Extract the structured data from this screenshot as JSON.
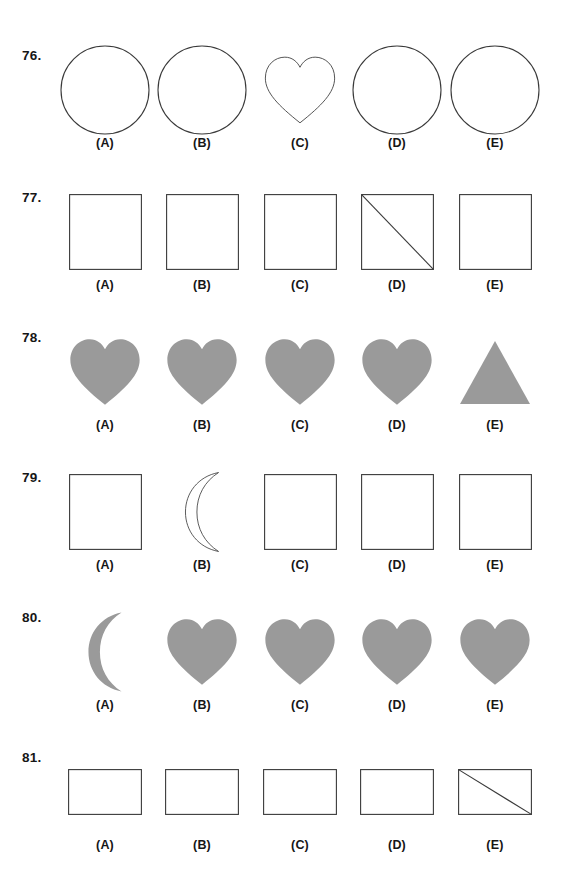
{
  "page": {
    "background_color": "#ffffff",
    "outline_color": "#3a3a3a",
    "fill_color": "#9a9a9a",
    "text_color": "#161616"
  },
  "option_labels": [
    "(A)",
    "(B)",
    "(C)",
    "(D)",
    "(E)"
  ],
  "rows": [
    {
      "number": "76.",
      "shapes": [
        {
          "name": "circle-outline",
          "type": "circle",
          "style": "outline"
        },
        {
          "name": "circle-outline",
          "type": "circle",
          "style": "outline"
        },
        {
          "name": "heart-outline",
          "type": "heart",
          "style": "outline"
        },
        {
          "name": "circle-outline",
          "type": "circle",
          "style": "outline"
        },
        {
          "name": "circle-outline",
          "type": "circle",
          "style": "outline"
        }
      ],
      "labels": [
        "(A)",
        "(B)",
        "(C)",
        "(D)",
        "(E)"
      ]
    },
    {
      "number": "77.",
      "shapes": [
        {
          "name": "square-outline",
          "type": "square",
          "style": "outline"
        },
        {
          "name": "square-outline",
          "type": "square",
          "style": "outline"
        },
        {
          "name": "square-outline",
          "type": "square",
          "style": "outline"
        },
        {
          "name": "square-with-diagonal",
          "type": "square-diagonal",
          "style": "outline"
        },
        {
          "name": "square-outline",
          "type": "square",
          "style": "outline"
        }
      ],
      "labels": [
        "(A)",
        "(B)",
        "(C)",
        "(D)",
        "(E)"
      ]
    },
    {
      "number": "78.",
      "shapes": [
        {
          "name": "heart-filled",
          "type": "heart",
          "style": "filled"
        },
        {
          "name": "heart-filled",
          "type": "heart",
          "style": "filled"
        },
        {
          "name": "heart-filled",
          "type": "heart",
          "style": "filled"
        },
        {
          "name": "heart-filled",
          "type": "heart",
          "style": "filled"
        },
        {
          "name": "triangle-filled",
          "type": "triangle",
          "style": "filled"
        }
      ],
      "labels": [
        "(A)",
        "(B)",
        "(C)",
        "(D)",
        "(E)"
      ]
    },
    {
      "number": "79.",
      "shapes": [
        {
          "name": "square-outline",
          "type": "square",
          "style": "outline"
        },
        {
          "name": "crescent-outline",
          "type": "crescent",
          "style": "outline"
        },
        {
          "name": "square-outline",
          "type": "square",
          "style": "outline"
        },
        {
          "name": "square-outline",
          "type": "square",
          "style": "outline"
        },
        {
          "name": "square-outline",
          "type": "square",
          "style": "outline"
        }
      ],
      "labels": [
        "(A)",
        "(B)",
        "(C)",
        "(D)",
        "(E)"
      ]
    },
    {
      "number": "80.",
      "shapes": [
        {
          "name": "crescent-filled",
          "type": "crescent",
          "style": "filled"
        },
        {
          "name": "heart-filled",
          "type": "heart",
          "style": "filled"
        },
        {
          "name": "heart-filled",
          "type": "heart",
          "style": "filled"
        },
        {
          "name": "heart-filled",
          "type": "heart",
          "style": "filled"
        },
        {
          "name": "heart-filled",
          "type": "heart",
          "style": "filled"
        }
      ],
      "labels": [
        "(A)",
        "(B)",
        "(C)",
        "(D)",
        "(E)"
      ]
    },
    {
      "number": "81.",
      "shapes": [
        {
          "name": "rectangle-outline",
          "type": "rectangle",
          "style": "outline"
        },
        {
          "name": "rectangle-outline",
          "type": "rectangle",
          "style": "outline"
        },
        {
          "name": "rectangle-outline",
          "type": "rectangle",
          "style": "outline"
        },
        {
          "name": "rectangle-outline",
          "type": "rectangle",
          "style": "outline"
        },
        {
          "name": "rectangle-with-diagonal",
          "type": "rectangle-diagonal",
          "style": "outline"
        }
      ],
      "labels": [
        "(A)",
        "(B)",
        "(C)",
        "(D)",
        "(E)"
      ]
    }
  ]
}
